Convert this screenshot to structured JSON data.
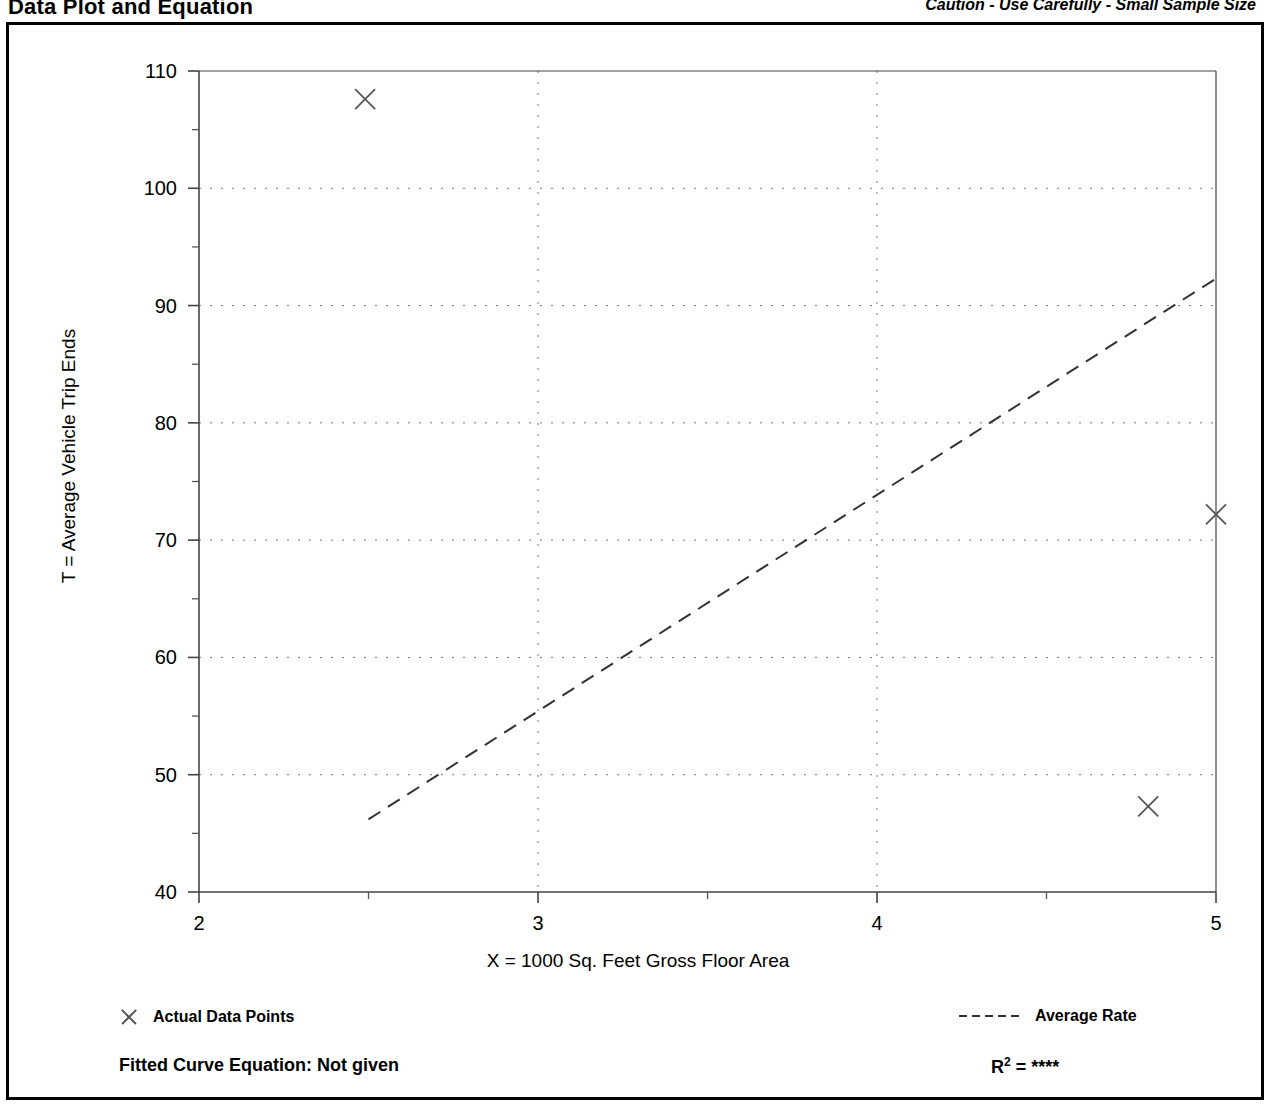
{
  "header": {
    "title": "Data Plot and Equation",
    "caution": "Caution - Use Carefully - Small Sample Size"
  },
  "legend": {
    "points_label": "Actual Data Points",
    "rate_label": "Average Rate"
  },
  "footer": {
    "fitted_equation": "Fitted Curve Equation:  Not given",
    "r_squared_prefix": "R",
    "r_squared_exponent": "2",
    "r_squared_value": "= ****"
  },
  "chart_data": {
    "type": "scatter",
    "title": "Data Plot and Equation",
    "xlabel": "X = 1000 Sq. Feet Gross Floor Area",
    "ylabel": "T = Average Vehicle Trip Ends",
    "xlim": [
      2,
      5
    ],
    "ylim": [
      40,
      110
    ],
    "xticks": [
      2,
      3,
      4,
      5
    ],
    "xtick_labels": [
      "2",
      "3",
      "4",
      "5"
    ],
    "xminor_ticks": [
      2.5,
      3.5,
      4.5
    ],
    "yticks": [
      40,
      50,
      60,
      70,
      80,
      90,
      100,
      110
    ],
    "ytick_labels": [
      "40",
      "50",
      "60",
      "70",
      "80",
      "90",
      "100",
      "110"
    ],
    "yminor_ticks": [
      45,
      55,
      65,
      75,
      85,
      95,
      105
    ],
    "grid": true,
    "grid_style": "dotted",
    "legend_position": "below-plot",
    "series": [
      {
        "name": "Actual Data Points",
        "type": "scatter",
        "marker": "x",
        "color": "#555555",
        "points": [
          {
            "x": 2.49,
            "y": 107.6
          },
          {
            "x": 5.0,
            "y": 72.2
          },
          {
            "x": 4.8,
            "y": 47.3
          }
        ]
      },
      {
        "name": "Average Rate",
        "type": "line",
        "style": "dashed",
        "color": "#333333",
        "points": [
          {
            "x": 2.5,
            "y": 46.2
          },
          {
            "x": 5.0,
            "y": 92.3
          }
        ]
      }
    ]
  }
}
